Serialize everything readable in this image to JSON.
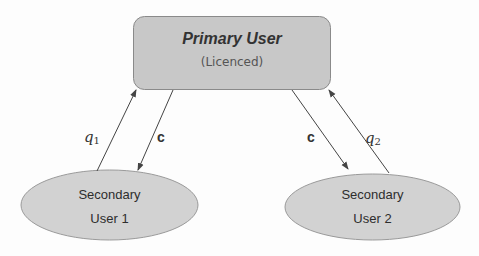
{
  "diagram": {
    "primary_node": {
      "title": "Primary User",
      "subtitle": "(Licenced)",
      "shape": "rounded-rectangle",
      "fill": "#c8c8c8",
      "stroke": "#8a8a8a"
    },
    "secondary_nodes": [
      {
        "line1": "Secondary",
        "line2": "User 1",
        "shape": "ellipse",
        "fill": "#d2d2d2",
        "stroke": "#9a9a9a"
      },
      {
        "line1": "Secondary",
        "line2": "User 2",
        "shape": "ellipse",
        "fill": "#d2d2d2",
        "stroke": "#9a9a9a"
      }
    ],
    "edges": [
      {
        "from": "Secondary User 1",
        "to": "Primary User",
        "label_main": "q",
        "label_sub": "1"
      },
      {
        "from": "Primary User",
        "to": "Secondary User 1",
        "label_main": "c",
        "label_sub": ""
      },
      {
        "from": "Primary User",
        "to": "Secondary User 2",
        "label_main": "c",
        "label_sub": ""
      },
      {
        "from": "Secondary User 2",
        "to": "Primary User",
        "label_main": "q",
        "label_sub": "2"
      }
    ],
    "colors": {
      "arrow": "#444444",
      "text": "#333333"
    }
  }
}
